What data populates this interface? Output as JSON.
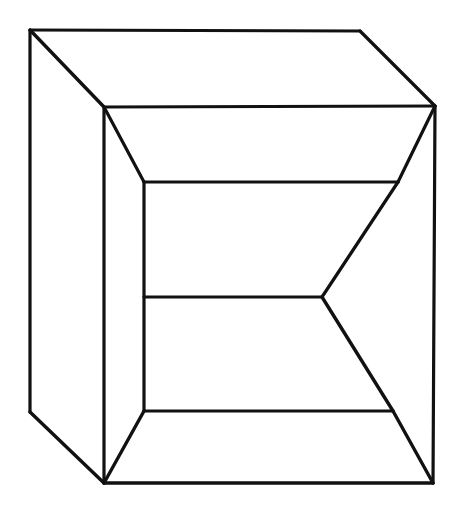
{
  "figure": {
    "style": "line-art",
    "background_color": "#ffffff",
    "stroke_color": "#111111",
    "stroke_width": 3.2,
    "canvas": {
      "width": 463,
      "height": 507
    },
    "vertices": {
      "outer_top_left": [
        30,
        30
      ],
      "outer_top_right": [
        360,
        31
      ],
      "outer_right_top": [
        435,
        106
      ],
      "outer_right_bottom": [
        433,
        483
      ],
      "outer_bottom_left": [
        104,
        483
      ],
      "outer_left_bottom": [
        30,
        412
      ],
      "rim_top_left": [
        104,
        107
      ],
      "rim_top_right": [
        435,
        106
      ],
      "inner_top_left": [
        144,
        182
      ],
      "inner_top_right": [
        398,
        182
      ],
      "inner_mid_left": [
        144,
        297
      ],
      "inner_mid_right": [
        322,
        297
      ],
      "inner_bottom_left": [
        144,
        411
      ],
      "inner_bottom_right": [
        393,
        411
      ]
    },
    "edges": [
      {
        "name": "outer-top-edge",
        "from": [
          30,
          30
        ],
        "to": [
          360,
          31
        ]
      },
      {
        "name": "outer-top-right-bevel",
        "from": [
          360,
          31
        ],
        "to": [
          435,
          106
        ]
      },
      {
        "name": "outer-right-edge",
        "from": [
          435,
          106
        ],
        "to": [
          433,
          483
        ]
      },
      {
        "name": "outer-bottom-edge",
        "from": [
          433,
          483
        ],
        "to": [
          104,
          483
        ]
      },
      {
        "name": "outer-bottom-left-bevel",
        "from": [
          104,
          483
        ],
        "to": [
          30,
          412
        ]
      },
      {
        "name": "outer-left-edge",
        "from": [
          30,
          412
        ],
        "to": [
          30,
          30
        ]
      },
      {
        "name": "rim-top-left-bevel",
        "from": [
          30,
          30
        ],
        "to": [
          104,
          107
        ]
      },
      {
        "name": "rim-top-horizontal",
        "from": [
          104,
          107
        ],
        "to": [
          435,
          106
        ]
      },
      {
        "name": "rim-left-vertical",
        "from": [
          104,
          107
        ],
        "to": [
          104,
          483
        ]
      },
      {
        "name": "inner-upper-left-bevel",
        "from": [
          104,
          107
        ],
        "to": [
          144,
          182
        ]
      },
      {
        "name": "inner-upper-right-bevel",
        "from": [
          435,
          106
        ],
        "to": [
          398,
          182
        ]
      },
      {
        "name": "inner-top-horizontal",
        "from": [
          144,
          182
        ],
        "to": [
          398,
          182
        ]
      },
      {
        "name": "inner-left-vertical",
        "from": [
          144,
          182
        ],
        "to": [
          144,
          411
        ]
      },
      {
        "name": "inner-right-vertical",
        "from": [
          398,
          182
        ],
        "to": [
          322,
          297
        ]
      },
      {
        "name": "inner-mid-horizontal",
        "from": [
          144,
          297
        ],
        "to": [
          322,
          297
        ]
      },
      {
        "name": "inner-lower-right-diagonal",
        "from": [
          322,
          297
        ],
        "to": [
          393,
          411
        ]
      },
      {
        "name": "inner-bottom-horizontal",
        "from": [
          144,
          411
        ],
        "to": [
          393,
          411
        ]
      },
      {
        "name": "inner-lower-left-bevel",
        "from": [
          144,
          411
        ],
        "to": [
          104,
          483
        ]
      },
      {
        "name": "inner-lower-right-bevel",
        "from": [
          393,
          411
        ],
        "to": [
          433,
          483
        ]
      }
    ]
  }
}
